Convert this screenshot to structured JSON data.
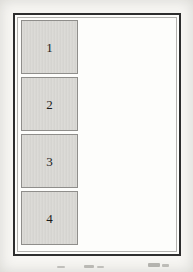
{
  "figure": {
    "boxes": [
      {
        "label": "1"
      },
      {
        "label": "2"
      },
      {
        "label": "3"
      },
      {
        "label": "4"
      }
    ],
    "colors": {
      "page_bg": "#f7f6f3",
      "sheet_bg": "#fdfdfb",
      "frame_border": "#2e2e2e",
      "inner_line": "#b3b2af",
      "box_fill": "#d8d7d3",
      "box_border": "#8f8e8b",
      "digit": "#1c1c1c"
    }
  }
}
